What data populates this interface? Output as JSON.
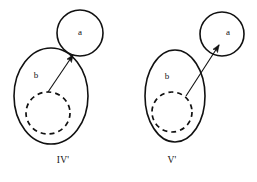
{
  "diagram": {
    "background_color": "#ffffff",
    "stroke_color": "#111111",
    "figures": [
      {
        "caption": "IV'",
        "caption_x": 63,
        "caption_y": 161,
        "outer_label": "b",
        "outer_label_x": 36,
        "outer_label_y": 76,
        "inner_label": "a",
        "inner_label_x": 80,
        "inner_label_y": 33,
        "big_ellipse": {
          "cx": 51,
          "cy": 96,
          "rx": 37,
          "ry": 48
        },
        "dashed_circle": {
          "cx": 48,
          "cy": 113,
          "rx": 22,
          "ry": 21
        },
        "small_circle": {
          "cx": 80,
          "cy": 33,
          "r": 23
        },
        "arrow": {
          "x1": 48,
          "y1": 92,
          "x2": 73,
          "y2": 55
        },
        "relation": "tangent"
      },
      {
        "caption": "V'",
        "caption_x": 172,
        "caption_y": 161,
        "outer_label": "b",
        "outer_label_x": 167,
        "outer_label_y": 77,
        "inner_label": "a",
        "inner_label_x": 228,
        "inner_label_y": 33,
        "big_ellipse": {
          "cx": 175,
          "cy": 96,
          "rx": 30,
          "ry": 46
        },
        "dashed_circle": {
          "cx": 172,
          "cy": 112,
          "rx": 20,
          "ry": 20
        },
        "small_circle": {
          "cx": 222,
          "cy": 34,
          "r": 22
        },
        "arrow": {
          "x1": 186,
          "y1": 96,
          "x2": 219,
          "y2": 45
        },
        "relation": "disjoint"
      }
    ]
  }
}
